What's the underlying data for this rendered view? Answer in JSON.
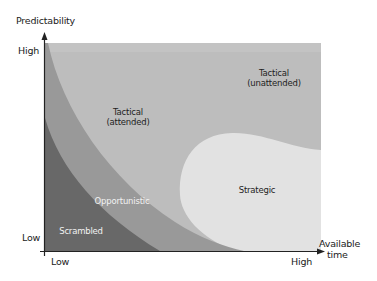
{
  "diagram": {
    "y_axis": {
      "title": "Predictability",
      "tick_high": "High",
      "tick_low": "Low"
    },
    "x_axis": {
      "title_line1": "Available",
      "title_line2": "time",
      "tick_low": "Low",
      "tick_high": "High"
    },
    "zones": [
      {
        "id": "tactical-unattended",
        "line1": "Tactical",
        "line2": "(unattended)",
        "color": "#bdbdbd"
      },
      {
        "id": "tactical-attended",
        "line1": "Tactical",
        "line2": "(attended)",
        "color": "#bdbdbd"
      },
      {
        "id": "strategic",
        "line1": "Strategic",
        "color": "#e2e2e2"
      },
      {
        "id": "opportunistic",
        "line1": "Opportunistic",
        "color": "#999999"
      },
      {
        "id": "scrambled",
        "line1": "Scrambled",
        "color": "#686868"
      }
    ],
    "axis_color": "#222222"
  }
}
